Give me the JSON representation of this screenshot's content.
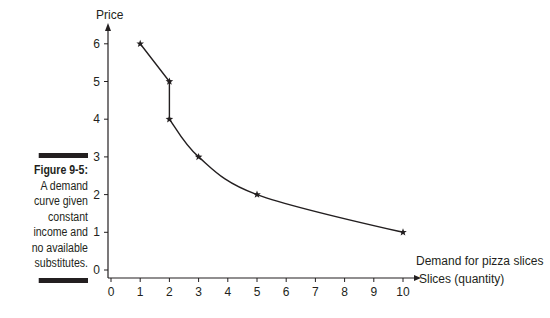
{
  "caption": {
    "figure_label": "Figure 9-5:",
    "lines": [
      "A demand",
      "curve given",
      "constant",
      "income and",
      "no available",
      "substitutes."
    ]
  },
  "chart_data": {
    "type": "line",
    "title": "",
    "xlabel": "Slices (quantity)",
    "ylabel": "Price",
    "xlim": [
      0,
      10
    ],
    "ylim": [
      0,
      6
    ],
    "x_ticks": [
      "0",
      "1",
      "2",
      "3",
      "4",
      "5",
      "6",
      "7",
      "8",
      "9",
      "10"
    ],
    "y_ticks": [
      "0",
      "1",
      "2",
      "3",
      "4",
      "5",
      "6"
    ],
    "grid": false,
    "series": [
      {
        "name": "Demand for pizza slices",
        "points": [
          [
            1,
            6
          ],
          [
            2,
            5
          ],
          [
            2,
            4
          ],
          [
            3,
            3
          ],
          [
            5,
            2
          ],
          [
            10,
            1
          ]
        ],
        "marker": "star"
      }
    ],
    "annotations": [
      {
        "text": "Demand for pizza slices",
        "x": 10,
        "y": 1
      }
    ],
    "line_color": "#231f20"
  }
}
